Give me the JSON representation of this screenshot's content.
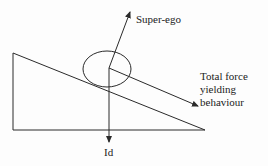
{
  "diagram": {
    "labels": {
      "superego": "Super-ego",
      "total_force_line1": "Total force",
      "total_force_line2": "yielding",
      "total_force_line3": "behaviour",
      "id": "Id"
    },
    "colors": {
      "stroke": "#2a2a2a",
      "text": "#222222",
      "background": "#fdfdfd"
    }
  }
}
